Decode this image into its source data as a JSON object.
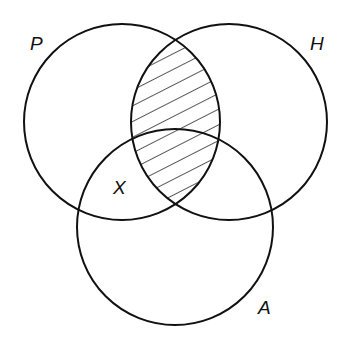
{
  "diagram": {
    "type": "venn",
    "sets": [
      {
        "id": "P",
        "label": "P",
        "cx": 122,
        "cy": 122,
        "r": 98,
        "label_x": 30,
        "label_y": 50
      },
      {
        "id": "H",
        "label": "H",
        "cx": 229,
        "cy": 122,
        "r": 98,
        "label_x": 310,
        "label_y": 50
      },
      {
        "id": "A",
        "label": "A",
        "cx": 175,
        "cy": 227,
        "r": 98,
        "label_x": 258,
        "label_y": 314
      }
    ],
    "region_marker": {
      "label": "X",
      "x": 113,
      "y": 194
    },
    "shaded_region": "P ∩ H",
    "stroke_color": "#111111",
    "hatch_color": "#111111"
  }
}
